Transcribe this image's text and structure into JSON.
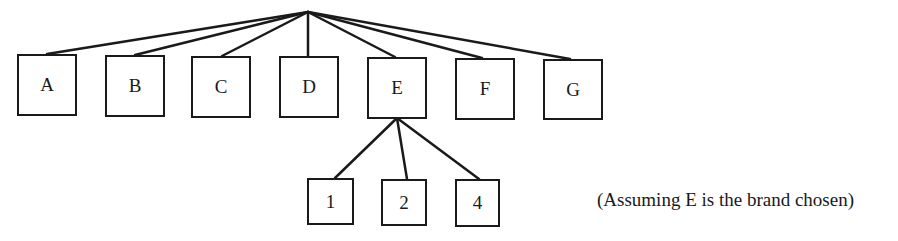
{
  "diagram": {
    "type": "tree",
    "root": {
      "label": ""
    },
    "brands": [
      {
        "id": "A",
        "label": "A"
      },
      {
        "id": "B",
        "label": "B"
      },
      {
        "id": "C",
        "label": "C"
      },
      {
        "id": "D",
        "label": "D"
      },
      {
        "id": "E",
        "label": "E"
      },
      {
        "id": "F",
        "label": "F"
      },
      {
        "id": "G",
        "label": "G"
      }
    ],
    "chosen_brand": "E",
    "children_of_chosen": [
      {
        "id": "1",
        "label": "1"
      },
      {
        "id": "2",
        "label": "2"
      },
      {
        "id": "4",
        "label": "4"
      }
    ],
    "note": "(Assuming E is the brand chosen)",
    "line_color": "#1a1a1a"
  }
}
